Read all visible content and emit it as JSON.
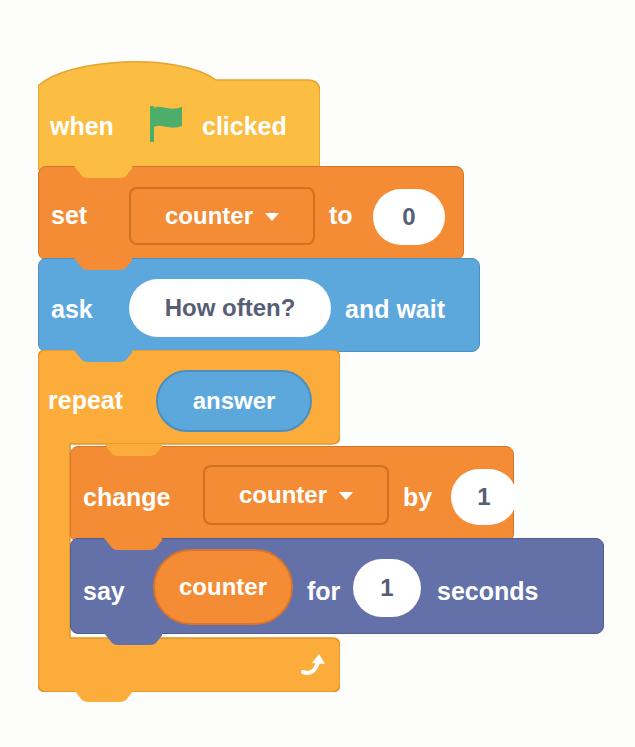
{
  "colors": {
    "events": "#fbbd42",
    "variables": "#f38c34",
    "sensing": "#5ca7dc",
    "looks": "#6470a8",
    "control": "#fbac3a",
    "flag": "#4cae6a",
    "reporter_text": "#575e75"
  },
  "script": {
    "hat": {
      "label_before": "when",
      "icon": "green-flag-icon",
      "label_after": "clicked"
    },
    "set_block": {
      "label": "set",
      "variable": "counter",
      "label_to": "to",
      "value": "0"
    },
    "ask_block": {
      "label": "ask",
      "question": "How often?",
      "label_after": "and wait"
    },
    "repeat_block": {
      "label": "repeat",
      "times_reporter": "answer",
      "loop_icon": "loop-arrow-icon",
      "children": {
        "change_block": {
          "label": "change",
          "variable": "counter",
          "label_by": "by",
          "value": "1"
        },
        "say_block": {
          "label": "say",
          "reporter": "counter",
          "label_for": "for",
          "value": "1",
          "label_after": "seconds"
        }
      }
    }
  }
}
